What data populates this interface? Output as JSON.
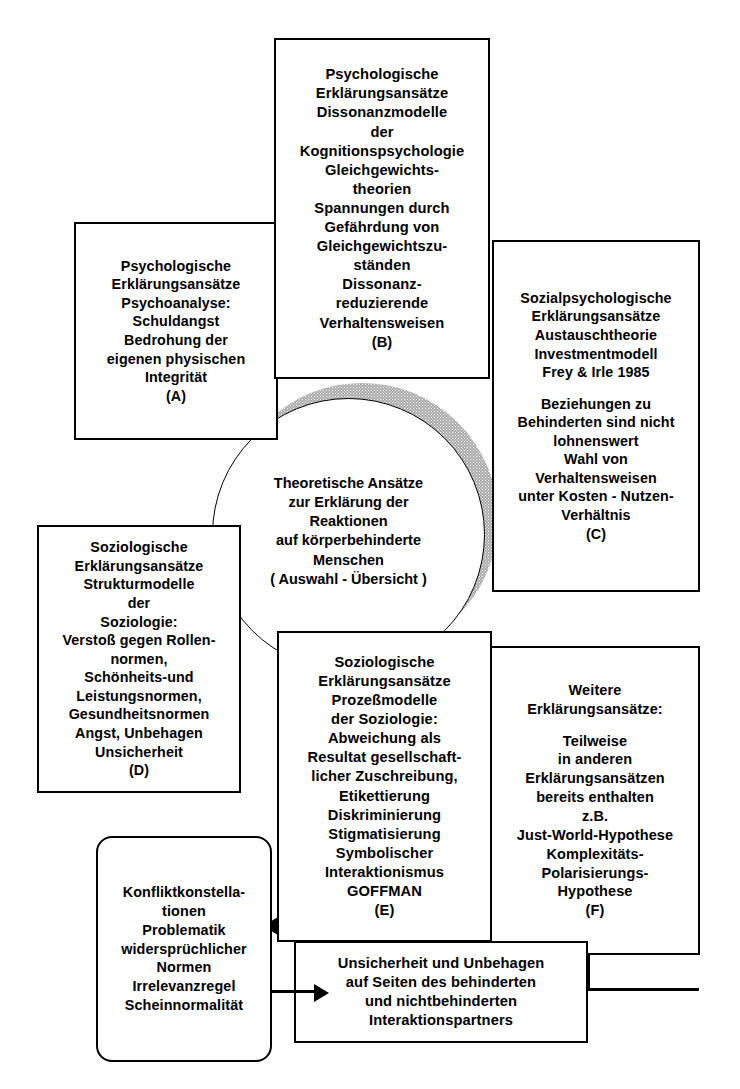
{
  "diagram": {
    "center": {
      "name": "central-concept",
      "lines": [
        "Theoretische Ansätze",
        "zur Erklärung der",
        "Reaktionen",
        "auf körperbehinderte",
        "Menschen",
        "( Auswahl - Übersicht )"
      ]
    },
    "boxes": {
      "a": {
        "label": "(A)",
        "lines": [
          "Psychologische",
          "Erklärungsansätze",
          "Psychoanalyse:",
          "Schuldangst",
          "Bedrohung der",
          "eigenen physischen",
          "Integrität",
          "(A)"
        ]
      },
      "b": {
        "label": "(B)",
        "lines": [
          "Psychologische",
          "Erklärungsansätze",
          "Dissonanzmodelle",
          "der",
          "Kognitionspsychologie",
          "Gleichgewichts-",
          "theorien",
          "Spannungen durch",
          "Gefährdung von",
          "Gleichgewichtszu-",
          "ständen",
          "Dissonanz-",
          "reduzierende",
          "Verhaltensweisen",
          "(B)"
        ]
      },
      "c": {
        "label": "(C)",
        "lines": [
          "Sozialpsychologische",
          "Erklärungsansätze",
          "Austauschtheorie",
          "Investmentmodell",
          "Frey & Irle 1985",
          "",
          "Beziehungen zu",
          "Behinderten sind nicht",
          "lohnenswert",
          "Wahl von",
          "Verhaltensweisen",
          "unter Kosten - Nutzen-",
          "Verhältnis",
          "(C)"
        ]
      },
      "d": {
        "label": "(D)",
        "lines": [
          "Soziologische",
          "Erklärungsansätze",
          "Strukturmodelle",
          "der",
          "Soziologie:",
          "Verstoß gegen Rollen-",
          "normen,",
          "Schönheits-und",
          "Leistungsnormen,",
          "Gesundheitsnormen",
          "Angst, Unbehagen",
          "Unsicherheit",
          "(D)"
        ]
      },
      "e": {
        "label": "(E)",
        "lines": [
          "Soziologische",
          "Erklärungsansätze",
          "Prozeßmodelle",
          "der Soziologie:",
          "Abweichung als",
          "Resultat gesellschaft-",
          "licher Zuschreibung,",
          "Etikettierung",
          "Diskriminierung",
          "Stigmatisierung",
          "Symbolischer",
          "Interaktionismus",
          "GOFFMAN",
          "(E)"
        ]
      },
      "f": {
        "label": "(F)",
        "lines": [
          "Weitere",
          "Erklärungsansätze:",
          "",
          "Teilweise",
          "in anderen",
          "Erklärungsansätzen",
          "bereits enthalten",
          "z.B.",
          "Just-World-Hypothese",
          "Komplexitäts-",
          "Polarisierungs-",
          "Hypothese",
          "(F)"
        ]
      },
      "conflict": {
        "lines": [
          "Konfliktkonstella-",
          "tionen",
          "Problematik",
          "widersprüchlicher",
          "Normen",
          "Irrelevanzregel",
          "Scheinnormalität"
        ]
      },
      "result": {
        "lines": [
          "Unsicherheit und Unbehagen",
          "auf  Seiten des behinderten",
          "und nichtbehinderten",
          "Interaktionspartners"
        ]
      }
    },
    "colors": {
      "stroke": "#000000",
      "background": "#ffffff",
      "shadow": "#a8a8a8"
    }
  }
}
